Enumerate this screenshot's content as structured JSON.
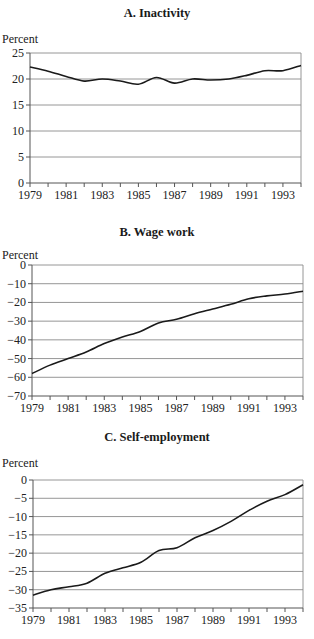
{
  "chart_data": [
    {
      "type": "line",
      "title": "A. Inactivity",
      "ylabel": "Percent",
      "xlabel": "",
      "x": [
        1979,
        1980,
        1981,
        1982,
        1983,
        1984,
        1985,
        1986,
        1987,
        1988,
        1989,
        1990,
        1991,
        1992,
        1993,
        1994
      ],
      "x_tick_labels": [
        "1979",
        "1981",
        "1983",
        "1985",
        "1987",
        "1989",
        "1991",
        "1993"
      ],
      "y_ticks": [
        0,
        5,
        10,
        15,
        20,
        25
      ],
      "ylim": [
        0,
        25
      ],
      "grid": true,
      "series": [
        {
          "name": "Inactivity",
          "values": [
            22.3,
            21.5,
            20.5,
            19.6,
            20.0,
            19.6,
            19.0,
            20.3,
            19.2,
            20.0,
            19.8,
            20.0,
            20.7,
            21.6,
            21.6,
            22.6
          ]
        }
      ]
    },
    {
      "type": "line",
      "title": "B. Wage work",
      "ylabel": "Percent",
      "xlabel": "",
      "x": [
        1979,
        1980,
        1981,
        1982,
        1983,
        1984,
        1985,
        1986,
        1987,
        1988,
        1989,
        1990,
        1991,
        1992,
        1993,
        1994
      ],
      "x_tick_labels": [
        "1979",
        "1981",
        "1983",
        "1985",
        "1987",
        "1989",
        "1991",
        "1993"
      ],
      "y_ticks": [
        0,
        -10,
        -20,
        -30,
        -40,
        -50,
        -60,
        -70
      ],
      "ylim": [
        -70,
        0
      ],
      "grid": true,
      "series": [
        {
          "name": "Wage work",
          "values": [
            -58,
            -53.5,
            -50,
            -46.5,
            -42,
            -38.5,
            -35.5,
            -31,
            -29,
            -26,
            -23.5,
            -21,
            -18,
            -16.5,
            -15.5,
            -14
          ]
        }
      ]
    },
    {
      "type": "line",
      "title": "C. Self-employment",
      "ylabel": "Percent",
      "xlabel": "",
      "x": [
        1979,
        1980,
        1981,
        1982,
        1983,
        1984,
        1985,
        1986,
        1987,
        1988,
        1989,
        1990,
        1991,
        1992,
        1993,
        1994
      ],
      "x_tick_labels": [
        "1979",
        "1981",
        "1983",
        "1985",
        "1987",
        "1989",
        "1991",
        "1993"
      ],
      "y_ticks": [
        0,
        -5,
        -10,
        -15,
        -20,
        -25,
        -30,
        -35
      ],
      "ylim": [
        -35,
        0
      ],
      "grid": true,
      "series": [
        {
          "name": "Self-employment",
          "values": [
            -31.5,
            -30,
            -29.2,
            -28.2,
            -25.5,
            -24,
            -22.5,
            -19.3,
            -18.5,
            -15.8,
            -13.8,
            -11.3,
            -8.3,
            -5.8,
            -4,
            -1.3
          ]
        }
      ]
    }
  ],
  "panels": [
    {
      "title": "A. Inactivity",
      "ylabel": "Percent"
    },
    {
      "title": "B. Wage work",
      "ylabel": "Percent"
    },
    {
      "title": "C. Self-employment",
      "ylabel": "Percent"
    }
  ],
  "style": {
    "line_color": "#1a1a1a",
    "grid_color": "#8a8a8a",
    "axis_color": "#555555"
  }
}
